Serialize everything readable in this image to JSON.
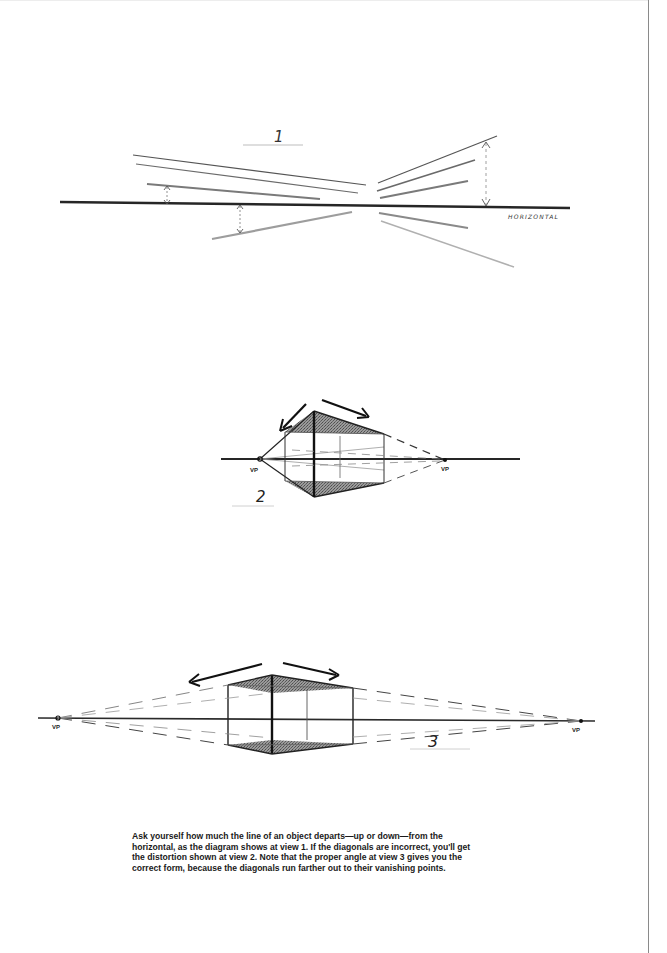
{
  "diagram_1": {
    "view_label": "1",
    "horizon_label": "HORIZONTAL"
  },
  "diagram_2": {
    "view_label": "2",
    "left_vp_label": "VP",
    "right_vp_label": "VP"
  },
  "diagram_3": {
    "view_label": "3",
    "left_vp_label": "VP",
    "right_vp_label": "VP"
  },
  "caption": {
    "text": "Ask yourself how much the line of an object departs—up or down—from the horizontal, as the diagram shows at view 1. If the diagonals are incorrect, you'll get the distortion shown at view 2. Note that the proper angle at view 3 gives you the correct form, because the diagonals run farther out to their vanishing points."
  },
  "colors": {
    "ink": "#1e1e1e",
    "pencil": "#6e6e6e",
    "light_pencil": "#a8a8a8",
    "shade": "#7a7a7a"
  }
}
